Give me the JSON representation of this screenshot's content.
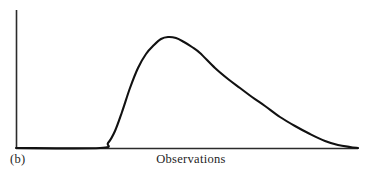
{
  "figure": {
    "panel_label": "(b)",
    "background_color": "#ffffff",
    "axis_color": "#2b2b2b",
    "curve_color": "#111111",
    "width": 368,
    "height": 173
  },
  "chart_data": {
    "type": "line",
    "title": "",
    "subtitle": "",
    "panel": "(b)",
    "xlabel": "Observations",
    "ylabel": "",
    "annotations": [
      "(b)"
    ],
    "legend": [],
    "legend_position": "none",
    "grid": false,
    "axis_ticks": {
      "x": [],
      "y": []
    },
    "xlim": [
      0,
      100
    ],
    "ylim": [
      0,
      100
    ],
    "series": [
      {
        "name": "frequency",
        "x": [
          0,
          5,
          10,
          15,
          20,
          24,
          26,
          28,
          30,
          33,
          36,
          39,
          42,
          45,
          48,
          52,
          56,
          60,
          64,
          68,
          72,
          76,
          80,
          84,
          88,
          92,
          96,
          100
        ],
        "values": [
          0,
          0,
          0,
          0,
          0,
          1,
          3,
          8,
          18,
          38,
          60,
          79,
          92,
          98,
          100,
          96,
          86,
          73,
          59,
          46,
          35,
          25,
          17,
          11,
          6,
          3,
          1,
          0
        ]
      }
    ],
    "curve_points_px": [
      {
        "x": 16,
        "y": 148
      },
      {
        "x": 100,
        "y": 148
      },
      {
        "x": 108,
        "y": 143
      },
      {
        "x": 115,
        "y": 131
      },
      {
        "x": 122,
        "y": 112
      },
      {
        "x": 130,
        "y": 88
      },
      {
        "x": 138,
        "y": 68
      },
      {
        "x": 146,
        "y": 54
      },
      {
        "x": 154,
        "y": 45
      },
      {
        "x": 161,
        "y": 39
      },
      {
        "x": 168,
        "y": 37
      },
      {
        "x": 176,
        "y": 38
      },
      {
        "x": 184,
        "y": 42
      },
      {
        "x": 192,
        "y": 47
      },
      {
        "x": 200,
        "y": 53
      },
      {
        "x": 215,
        "y": 68
      },
      {
        "x": 228,
        "y": 79
      },
      {
        "x": 240,
        "y": 88
      },
      {
        "x": 252,
        "y": 97
      },
      {
        "x": 265,
        "y": 106
      },
      {
        "x": 280,
        "y": 117
      },
      {
        "x": 295,
        "y": 126
      },
      {
        "x": 310,
        "y": 134
      },
      {
        "x": 325,
        "y": 141
      },
      {
        "x": 338,
        "y": 145
      },
      {
        "x": 350,
        "y": 147
      },
      {
        "x": 358,
        "y": 148
      }
    ],
    "axes_px": {
      "y_axis": {
        "x": 16,
        "y_top": 10,
        "y_bottom": 148
      },
      "x_axis": {
        "y": 148,
        "x_left": 16,
        "x_right": 358
      }
    }
  }
}
